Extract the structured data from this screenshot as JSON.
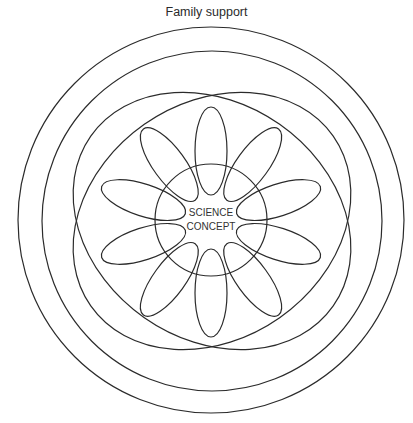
{
  "diagram": {
    "outer_label": "Family support",
    "center_label_line1": "SCIENCE",
    "center_label_line2": "CONCEPT",
    "rings": [
      {
        "name": "outer-ring",
        "cx": 211,
        "cy": 220,
        "r": 193
      },
      {
        "name": "second-ring",
        "cx": 212,
        "cy": 221,
        "r": 170
      },
      {
        "name": "core-ring",
        "cx": 211,
        "cy": 220,
        "r": 56
      }
    ],
    "crossed_ellipses": [
      {
        "cx": 212,
        "cy": 221,
        "rx": 148,
        "ry": 118,
        "rotate": 35
      },
      {
        "cx": 212,
        "cy": 221,
        "rx": 148,
        "ry": 118,
        "rotate": -35
      }
    ],
    "petals": {
      "count": 10,
      "center": [
        211,
        222
      ],
      "distance": 71,
      "rx": 16,
      "ry": 44,
      "start_angle_deg": 90
    },
    "line_color": "#2b2b2b"
  }
}
